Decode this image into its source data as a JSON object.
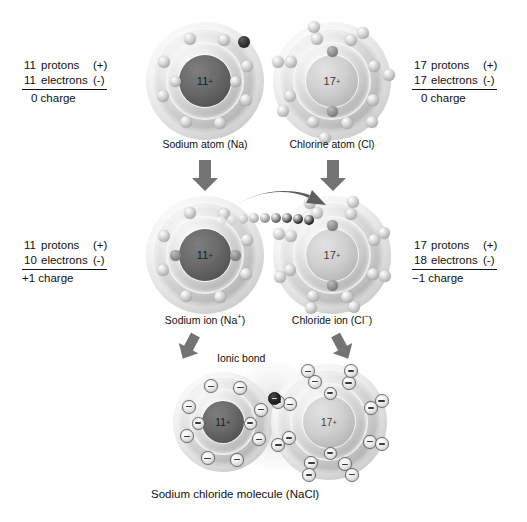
{
  "diagram": {
    "type": "ionic-bond-formation"
  },
  "labels": {
    "sodium_atom_stats": {
      "protons_count": "11",
      "protons_word": "protons",
      "protons_sign": "(+)",
      "electrons_count": "11",
      "electrons_word": "electrons",
      "electrons_sign": "(-)",
      "charge": "0 charge"
    },
    "chlorine_atom_stats": {
      "protons_count": "17",
      "protons_word": "protons",
      "protons_sign": "(+)",
      "electrons_count": "17",
      "electrons_word": "electrons",
      "electrons_sign": "(-)",
      "charge": "0 charge"
    },
    "sodium_ion_stats": {
      "protons_count": "11",
      "protons_word": "protons",
      "protons_sign": "(+)",
      "electrons_count": "10",
      "electrons_word": "electrons",
      "electrons_sign": "(-)",
      "charge": "+1 charge"
    },
    "chloride_ion_stats": {
      "protons_count": "17",
      "protons_word": "protons",
      "protons_sign": "(+)",
      "electrons_count": "18",
      "electrons_word": "electrons",
      "electrons_sign": "(-)",
      "charge": "−1  charge"
    }
  },
  "captions": {
    "sodium_atom": "Sodium atom (Na)",
    "chlorine_atom": "Chlorine atom (Cl)",
    "sodium_ion_base": "Sodium ion (Na",
    "sodium_ion_sup": "+",
    "sodium_ion_close": ")",
    "chloride_ion_base": "Chloride ion (Cl",
    "chloride_ion_sup": "−",
    "chloride_ion_close": ")",
    "ionic_bond": "Ionic bond",
    "molecule": "Sodium chloride molecule (NaCl)"
  },
  "nuclei": {
    "sodium_number": "11",
    "sodium_charge_sup": "+",
    "chlorine_number": "17",
    "chlorine_charge_sup": "+"
  },
  "chart_data": {
    "type": "diagram",
    "stages": [
      {
        "stage": 1,
        "name": "neutral atoms",
        "species": [
          {
            "label": "Sodium atom (Na)",
            "nucleus": "11+",
            "protons": 11,
            "electrons": 11,
            "charge": 0,
            "shells": [
              2,
              8,
              1
            ],
            "valence_electron_highlighted": true
          },
          {
            "label": "Chlorine atom (Cl)",
            "nucleus": "17+",
            "protons": 17,
            "electrons": 17,
            "charge": 0,
            "shells": [
              2,
              8,
              7
            ],
            "valence_electron_highlighted": false
          }
        ]
      },
      {
        "stage": 2,
        "name": "electron transfer to ions",
        "transfer": {
          "from": "Sodium",
          "to": "Chlorine",
          "electrons_transferred": 1
        },
        "species": [
          {
            "label": "Sodium ion (Na+)",
            "nucleus": "11+",
            "protons": 11,
            "electrons": 10,
            "charge": 1,
            "shells": [
              2,
              8
            ]
          },
          {
            "label": "Chloride ion (Cl-)",
            "nucleus": "17+",
            "protons": 17,
            "electrons": 18,
            "charge": -1,
            "shells": [
              2,
              8,
              8
            ]
          }
        ]
      },
      {
        "stage": 3,
        "name": "ionic compound",
        "label": "Sodium chloride molecule (NaCl)",
        "bond_label": "Ionic bond",
        "species": [
          {
            "label": "Na+",
            "nucleus": "11+",
            "shells": [
              2,
              8
            ]
          },
          {
            "label": "Cl-",
            "nucleus": "17+",
            "shells": [
              2,
              8,
              8
            ]
          }
        ]
      }
    ],
    "colors": {
      "electron_light": "#d0d0d0",
      "electron_dark": "#222222",
      "nucleus_sodium": "#5a5a5a",
      "nucleus_chlorine": "#c4c4c4",
      "arrow": "#6e6e6e",
      "background": "#ffffff"
    }
  }
}
